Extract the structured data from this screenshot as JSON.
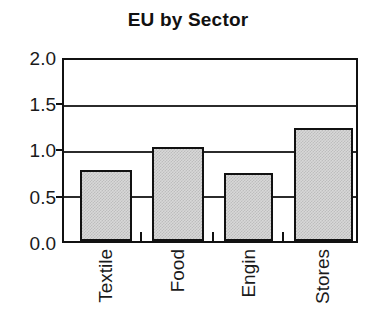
{
  "chart_data": {
    "type": "bar",
    "title": "EU by Sector",
    "xlabel": "",
    "ylabel": "",
    "categories": [
      "Textile",
      "Food",
      "Engin",
      "Stores"
    ],
    "values": [
      0.79,
      1.04,
      0.75,
      1.25
    ],
    "ylim": [
      0.0,
      2.0
    ],
    "yticks": [
      "0.0",
      "0.5",
      "1.0",
      "1.5",
      "2.0"
    ],
    "ytick_values": [
      0.0,
      0.5,
      1.0,
      1.5,
      2.0
    ],
    "grid": "horizontal",
    "legend": "none",
    "bar_fill_color": "#d8d8d8",
    "bar_edge_color": "#111111",
    "axis_color": "#111111",
    "background_color": "#ffffff",
    "xtick_label_rotation": 90
  }
}
